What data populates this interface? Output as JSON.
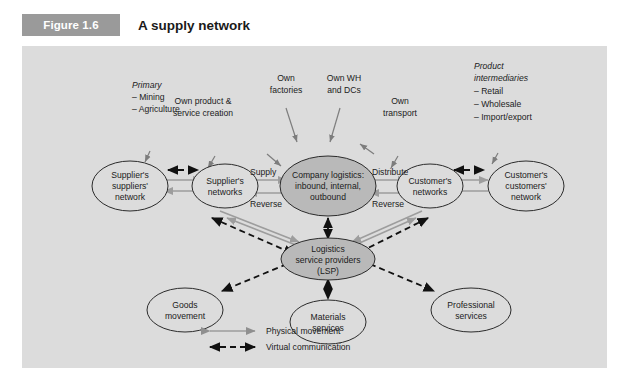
{
  "figure": {
    "badge": "Figure 1.6",
    "title": "A supply network"
  },
  "colors": {
    "badge_bg": "#9a9a9a",
    "panel_bg": "#dcdcdc",
    "node_fill_highlight": "#b9b9b9",
    "physical_arrow": "#9d9d9d",
    "virtual_arrow": "#111111"
  },
  "nodes": {
    "suppliers_suppliers": {
      "line1": "Supplier's",
      "line2": "suppliers'",
      "line3": "network"
    },
    "suppliers_networks": {
      "line1": "Supplier's",
      "line2": "networks"
    },
    "company_logistics": {
      "line1": "Company logistics:",
      "line2": "inbound, internal,",
      "line3": "outbound"
    },
    "customers_networks": {
      "line1": "Customer's",
      "line2": "networks"
    },
    "customers_customers": {
      "line1": "Customer's",
      "line2": "customers'",
      "line3": "network"
    },
    "lsp": {
      "line1": "Logistics",
      "line2": "service providers",
      "line3": "(LSP)"
    },
    "goods_movement": {
      "line1": "Goods",
      "line2": "movement"
    },
    "materials_services": {
      "line1": "Materials",
      "line2": "services"
    },
    "professional_services": {
      "line1": "Professional",
      "line2": "services"
    }
  },
  "edge_labels": {
    "supply": "Supply",
    "reverse_left": "Reverse",
    "distribute": "Distribute",
    "reverse_right": "Reverse"
  },
  "annotations": {
    "primary": {
      "head": "Primary",
      "items": [
        "– Mining",
        "– Agriculture"
      ]
    },
    "own_product": {
      "line1": "Own product &",
      "line2": "service creation"
    },
    "own_factories": {
      "line1": "Own",
      "line2": "factories"
    },
    "own_wh_dcs": {
      "line1": "Own WH",
      "line2": "and DCs"
    },
    "own_transport": {
      "line1": "Own",
      "line2": "transport"
    },
    "product_intermediaries": {
      "head1": "Product",
      "head2": "intermediaries",
      "items": [
        "– Retail",
        "– Wholesale",
        "– Import/export"
      ]
    }
  },
  "legend": {
    "physical": "Physical movement",
    "virtual": "Virtual communication"
  }
}
